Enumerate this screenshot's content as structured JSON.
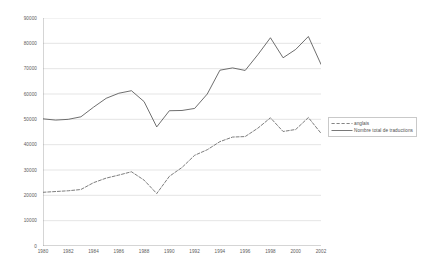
{
  "chart_data": {
    "type": "line",
    "title": "",
    "subtitle": "",
    "xlabel": "",
    "ylabel": "",
    "xlim": [
      1980,
      2002
    ],
    "ylim": [
      0,
      90000
    ],
    "grid": true,
    "grid_axis": "y",
    "legend_position": "right",
    "x": [
      1980,
      1981,
      1982,
      1983,
      1984,
      1985,
      1986,
      1987,
      1988,
      1989,
      1990,
      1991,
      1992,
      1993,
      1994,
      1995,
      1996,
      1997,
      1998,
      1999,
      2000,
      2001,
      2002
    ],
    "xtick_labels": [
      "1980",
      "1982",
      "1984",
      "1986",
      "1988",
      "1990",
      "1992",
      "1994",
      "1996",
      "1998",
      "2000",
      "2002"
    ],
    "xticks": [
      1980,
      1982,
      1984,
      1986,
      1988,
      1990,
      1992,
      1994,
      1996,
      1998,
      2000,
      2002
    ],
    "ytick_labels": [
      "0",
      "10000",
      "20000",
      "30000",
      "40000",
      "50000",
      "60000",
      "70000",
      "80000",
      "90000"
    ],
    "yticks": [
      0,
      10000,
      20000,
      30000,
      40000,
      50000,
      60000,
      70000,
      80000,
      90000
    ],
    "series": [
      {
        "name": "anglais",
        "style": "dashed",
        "color": "#666666",
        "values": [
          21200,
          21500,
          21800,
          22300,
          25000,
          26800,
          28000,
          29300,
          26000,
          20700,
          27500,
          31000,
          35800,
          38000,
          41200,
          43000,
          43200,
          46500,
          50600,
          45200,
          46000,
          50700,
          44500
        ]
      },
      {
        "name": "Nombre total de traductions",
        "style": "solid",
        "color": "#555555",
        "values": [
          50200,
          49700,
          50000,
          51000,
          54800,
          58300,
          60300,
          61300,
          57000,
          47000,
          53400,
          53500,
          54300,
          60000,
          69400,
          70300,
          69300,
          75500,
          82200,
          74300,
          77600,
          82700,
          71700
        ]
      }
    ]
  },
  "legend": {
    "entries": [
      {
        "label": "anglais"
      },
      {
        "label": "Nombre total de traductions"
      }
    ]
  }
}
